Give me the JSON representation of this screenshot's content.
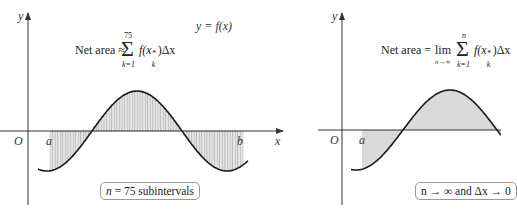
{
  "figure": {
    "left_panel": {
      "axis_labels": {
        "y": "y",
        "x": "x",
        "origin": "O",
        "a": "a",
        "b": "b"
      },
      "curve_label": "y = f(x)",
      "formula": {
        "prefix": "Net area ≈",
        "sum_upper": "75",
        "sum_lower": "k=1",
        "term": "f(x",
        "term_sub": "k",
        "term_sup": "*",
        "term_end": ")Δx"
      },
      "note": "n = 75 subintervals",
      "shading": "vertical hatching (75 rectangles)"
    },
    "right_panel": {
      "axis_labels": {
        "y": "y",
        "origin": "O",
        "a": "a"
      },
      "formula": {
        "prefix": "Net area =",
        "lim": "lim",
        "lim_sub": "n→∞",
        "sum_upper": "n",
        "sum_lower": "k=1",
        "term": "f(x",
        "term_sub": "k",
        "term_sup": "*",
        "term_end": ")Δx"
      },
      "note": "n → ∞ and Δx → 0",
      "shading": "solid gray fill"
    },
    "colors": {
      "curve": "#1a1a1a",
      "axis": "#333333",
      "hatch_fill": "#e4e4e4",
      "hatch_line": "#9a9a9a",
      "solid_fill": "#d9d9d9",
      "box_border": "#9a9a9a"
    }
  }
}
